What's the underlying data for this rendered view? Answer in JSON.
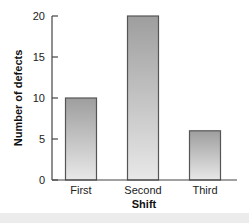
{
  "chart_data": {
    "type": "bar",
    "title": "",
    "categories": [
      "First",
      "Second",
      "Third"
    ],
    "values": [
      10,
      20,
      6
    ],
    "xlabel": "Shift",
    "ylabel": "Number of defects",
    "ylim": [
      0,
      20
    ],
    "yticks": [
      0,
      5,
      10,
      15,
      20
    ],
    "grid": false,
    "legend": null,
    "colors": {
      "bar_top": "#9e9e9e",
      "bar_bottom": "#e8e8e8",
      "bar_border": "#555555",
      "axis": "#444444"
    }
  }
}
